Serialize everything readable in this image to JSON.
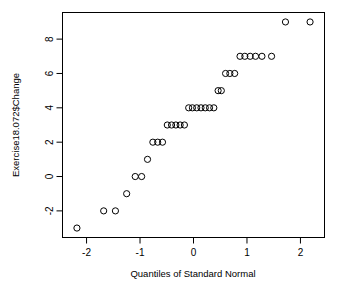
{
  "chart_data": {
    "type": "scatter",
    "title": "",
    "xlabel": "Quantiles of Standard Normal",
    "ylabel": "Exercise18.072$Change",
    "xlim": [
      -2.45,
      2.45
    ],
    "ylim": [
      -3.55,
      9.55
    ],
    "xticks": [
      -2,
      -1,
      0,
      1,
      2
    ],
    "xticklabels": [
      "-2",
      "-1",
      "0",
      "1",
      "2"
    ],
    "yticks": [
      -2,
      0,
      2,
      4,
      6,
      8
    ],
    "yticklabels": [
      "-2",
      "0",
      "2",
      "4",
      "6",
      "8"
    ],
    "grid": false,
    "legend": null,
    "marker": "open-circle",
    "marker_color": "#000000",
    "n_points": 36,
    "x": [
      -2.18,
      -1.68,
      -1.46,
      -1.25,
      -1.09,
      -0.99,
      -0.88,
      -0.77,
      -0.68,
      -0.59,
      -0.5,
      -0.42,
      -0.34,
      -0.26,
      -0.18,
      -0.11,
      -0.03,
      0.03,
      0.11,
      0.18,
      0.26,
      0.34,
      0.42,
      0.5,
      0.59,
      0.68,
      0.77,
      0.88,
      0.99,
      1.09,
      1.25,
      1.46,
      1.68,
      2.18,
      1.1,
      0.6
    ],
    "y": [
      -3,
      -2,
      -2,
      -1,
      0,
      0,
      1,
      2,
      2,
      2,
      3,
      3,
      3,
      3,
      3,
      4,
      4,
      4,
      4,
      4,
      4,
      4,
      5,
      5,
      6,
      6,
      7,
      7,
      7,
      7,
      7,
      9,
      9,
      9,
      6,
      6
    ],
    "points": [
      {
        "x": -2.18,
        "y": -3
      },
      {
        "x": -1.68,
        "y": -2
      },
      {
        "x": -1.46,
        "y": -2
      },
      {
        "x": -1.25,
        "y": -1
      },
      {
        "x": -1.09,
        "y": 0
      },
      {
        "x": -0.97,
        "y": 0
      },
      {
        "x": -0.86,
        "y": 1
      },
      {
        "x": -0.76,
        "y": 2
      },
      {
        "x": -0.67,
        "y": 2
      },
      {
        "x": -0.58,
        "y": 2
      },
      {
        "x": -0.49,
        "y": 3
      },
      {
        "x": -0.41,
        "y": 3
      },
      {
        "x": -0.33,
        "y": 3
      },
      {
        "x": -0.25,
        "y": 3
      },
      {
        "x": -0.17,
        "y": 3
      },
      {
        "x": -0.09,
        "y": 4
      },
      {
        "x": -0.02,
        "y": 4
      },
      {
        "x": 0.06,
        "y": 4
      },
      {
        "x": 0.14,
        "y": 4
      },
      {
        "x": 0.22,
        "y": 4
      },
      {
        "x": 0.3,
        "y": 4
      },
      {
        "x": 0.38,
        "y": 4
      },
      {
        "x": 0.46,
        "y": 5
      },
      {
        "x": 0.52,
        "y": 5
      },
      {
        "x": 0.6,
        "y": 6
      },
      {
        "x": 0.68,
        "y": 6
      },
      {
        "x": 0.77,
        "y": 6
      },
      {
        "x": 0.87,
        "y": 7
      },
      {
        "x": 0.96,
        "y": 7
      },
      {
        "x": 1.06,
        "y": 7
      },
      {
        "x": 1.16,
        "y": 7
      },
      {
        "x": 1.28,
        "y": 7
      },
      {
        "x": 1.46,
        "y": 7
      },
      {
        "x": 1.72,
        "y": 9
      },
      {
        "x": 2.18,
        "y": 9
      }
    ]
  },
  "axes": {
    "x_title": "Quantiles of Standard Normal",
    "y_title": "Exercise18.072$Change"
  }
}
